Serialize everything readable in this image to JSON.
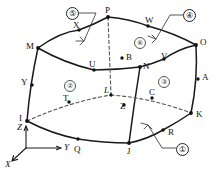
{
  "diagram": {
    "stroke_color": "#1a1a1a",
    "hidden_stroke_color": "#555555",
    "background": "#ffffff"
  },
  "corner_nodes": [
    {
      "id": "P",
      "x": 108,
      "y": 17,
      "hidden": false
    },
    {
      "id": "M",
      "x": 38,
      "y": 48,
      "hidden": false
    },
    {
      "id": "O",
      "x": 196,
      "y": 45,
      "hidden": false
    },
    {
      "id": "N",
      "x": 140,
      "y": 67,
      "hidden": false
    },
    {
      "id": "I",
      "x": 27,
      "y": 121,
      "hidden": false
    },
    {
      "id": "J",
      "x": 129,
      "y": 143,
      "hidden": false
    },
    {
      "id": "K",
      "x": 191,
      "y": 113,
      "hidden": false
    },
    {
      "id": "L",
      "x": 111,
      "y": 95,
      "hidden": true
    }
  ],
  "midside_nodes": [
    {
      "id": "X",
      "x": 79,
      "y": 30,
      "hidden": false
    },
    {
      "id": "W",
      "x": 148,
      "y": 26,
      "hidden": false
    },
    {
      "id": "U",
      "x": 94,
      "y": 70,
      "hidden": false
    },
    {
      "id": "V",
      "x": 164,
      "y": 59,
      "hidden": false
    },
    {
      "id": "B",
      "x": 122,
      "y": 58,
      "hidden": true
    },
    {
      "id": "Y",
      "x": 32,
      "y": 85,
      "hidden": false
    },
    {
      "id": "A",
      "x": 198,
      "y": 79,
      "hidden": false
    },
    {
      "id": "T",
      "x": 69,
      "y": 102,
      "hidden": true
    },
    {
      "id": "Z",
      "x": 124,
      "y": 105,
      "hidden": false
    },
    {
      "id": "C",
      "x": 152,
      "y": 98,
      "hidden": true
    },
    {
      "id": "Q",
      "x": 78,
      "y": 139,
      "hidden": false
    },
    {
      "id": "R",
      "x": 163,
      "y": 130,
      "hidden": false
    }
  ],
  "node_labels": [
    {
      "text": "P",
      "x": 105,
      "y": 6
    },
    {
      "text": "X",
      "x": 73,
      "y": 21
    },
    {
      "text": "W",
      "x": 145,
      "y": 16
    },
    {
      "text": "M",
      "x": 26,
      "y": 42
    },
    {
      "text": "O",
      "x": 200,
      "y": 38
    },
    {
      "text": "B",
      "x": 126,
      "y": 53
    },
    {
      "text": "U",
      "x": 89,
      "y": 60
    },
    {
      "text": "N",
      "x": 143,
      "y": 62
    },
    {
      "text": "V",
      "x": 161,
      "y": 52
    },
    {
      "text": "Y",
      "x": 21,
      "y": 78
    },
    {
      "text": "A",
      "x": 202,
      "y": 73
    },
    {
      "text": "L",
      "x": 104,
      "y": 86,
      "italic": true
    },
    {
      "text": "C",
      "x": 149,
      "y": 88
    },
    {
      "text": "T",
      "x": 63,
      "y": 94
    },
    {
      "text": "Z",
      "x": 120,
      "y": 102
    },
    {
      "text": "I",
      "x": 19,
      "y": 114
    },
    {
      "text": "K",
      "x": 196,
      "y": 110
    },
    {
      "text": "Q",
      "x": 74,
      "y": 145
    },
    {
      "text": "J",
      "x": 127,
      "y": 147
    },
    {
      "text": "R",
      "x": 168,
      "y": 128
    }
  ],
  "face_numbers": [
    {
      "label": "②",
      "x": 64,
      "y": 80
    },
    {
      "label": "③",
      "x": 158,
      "y": 76
    },
    {
      "label": "⑥",
      "x": 134,
      "y": 37
    }
  ],
  "callouts": [
    {
      "label": "⑤",
      "x": 66,
      "y": 7,
      "leader": "M 77,13 L 96,13 L 84,41",
      "arrow": {
        "x": 84,
        "y": 41,
        "angle": 115
      }
    },
    {
      "label": "④",
      "x": 183,
      "y": 9,
      "leader": "M 183,15 L 170,15 L 156,39",
      "arrow": {
        "x": 156,
        "y": 39,
        "angle": 120
      }
    },
    {
      "label": "①",
      "x": 176,
      "y": 143,
      "leader": "M 176,148 L 162,148 L 148,125",
      "arrow": {
        "x": 148,
        "y": 125,
        "angle": -60
      }
    }
  ],
  "axes": {
    "origin": {
      "x": 26,
      "y": 148
    },
    "labels": [
      {
        "text": "Z",
        "x": 17,
        "y": 123
      },
      {
        "text": "Y",
        "x": 64,
        "y": 143
      },
      {
        "text": "X",
        "x": 5,
        "y": 160
      }
    ]
  }
}
